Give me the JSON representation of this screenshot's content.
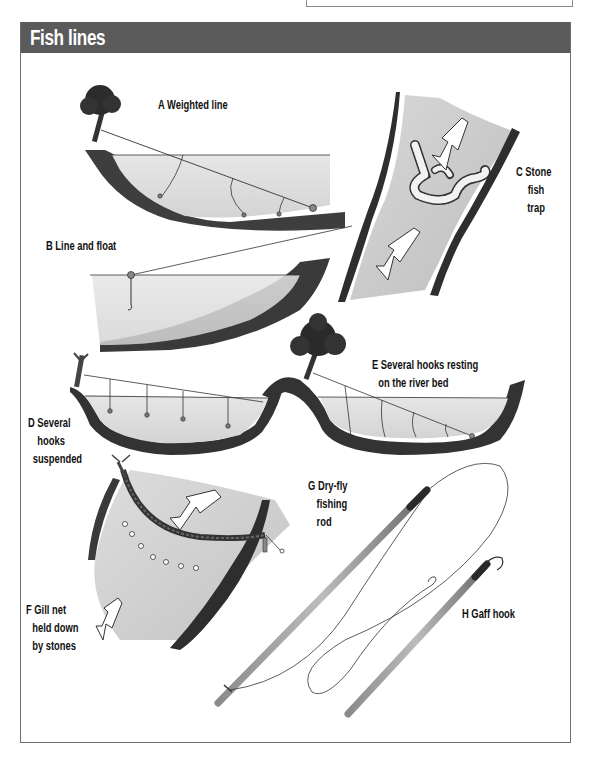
{
  "page": {
    "title": "Fish lines",
    "header_color": "#5a5a5a",
    "title_color": "#ffffff"
  },
  "labels": {
    "a": {
      "lines": [
        "A Weighted line"
      ]
    },
    "b": {
      "lines": [
        "B Line and float"
      ]
    },
    "c": {
      "lines": [
        "C Stone",
        "fish",
        "trap"
      ]
    },
    "d": {
      "lines": [
        "D Several",
        "hooks",
        "suspended"
      ]
    },
    "e": {
      "lines": [
        "E Several hooks resting",
        "on the river bed"
      ]
    },
    "f": {
      "lines": [
        "F Gill net",
        "held down",
        "by stones"
      ]
    },
    "g": {
      "lines": [
        "G Dry-fly",
        "fishing",
        "rod"
      ]
    },
    "h": {
      "lines": [
        "H Gaff hook"
      ]
    }
  },
  "illustrations": [
    {
      "id": "a",
      "name": "weighted-line",
      "icon": "tree-bank-weighted-line"
    },
    {
      "id": "b",
      "name": "line-and-float",
      "icon": "float-line"
    },
    {
      "id": "c",
      "name": "stone-fish-trap",
      "icon": "stream-stone-trap"
    },
    {
      "id": "d",
      "name": "several-hooks-suspended",
      "icon": "suspended-hooks"
    },
    {
      "id": "e",
      "name": "hooks-resting-on-river-bed",
      "icon": "bed-hooks"
    },
    {
      "id": "f",
      "name": "gill-net",
      "icon": "gill-net-stream"
    },
    {
      "id": "g",
      "name": "dry-fly-fishing-rod",
      "icon": "fishing-rod"
    },
    {
      "id": "h",
      "name": "gaff-hook",
      "icon": "gaff-hook"
    }
  ]
}
